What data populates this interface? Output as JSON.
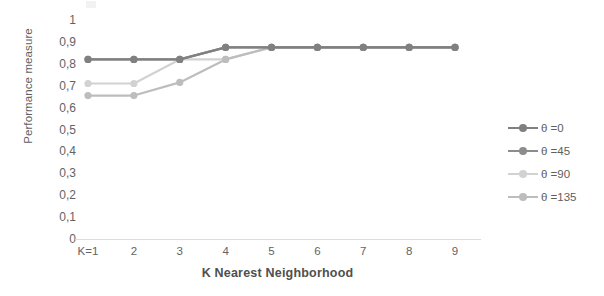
{
  "chart_data": {
    "type": "line",
    "title": "",
    "xlabel": "K Nearest Neighborhood",
    "ylabel": "Performance measure",
    "categories": [
      "K=1",
      "2",
      "3",
      "4",
      "5",
      "6",
      "7",
      "8",
      "9"
    ],
    "x": [
      1,
      2,
      3,
      4,
      5,
      6,
      7,
      8,
      9
    ],
    "ylim": [
      0,
      1
    ],
    "ytick_labels": [
      "1",
      "0,9",
      "0,8",
      "0,7",
      "0,6",
      "0,5",
      "0,4",
      "0,3",
      "0,2",
      "0,1",
      "0"
    ],
    "ytick_values": [
      1,
      0.9,
      0.8,
      0.7,
      0.6,
      0.5,
      0.4,
      0.3,
      0.2,
      0.1,
      0
    ],
    "grid": false,
    "legend_position": "right",
    "series": [
      {
        "name": "θ =0",
        "color": "#808080",
        "values": [
          0.82,
          0.82,
          0.82,
          0.875,
          0.875,
          0.875,
          0.875,
          0.875,
          0.875
        ]
      },
      {
        "name": "θ =45",
        "color": "#8c8c8c",
        "values": [
          0.82,
          0.82,
          0.82,
          0.875,
          0.875,
          0.875,
          0.875,
          0.875,
          0.875
        ]
      },
      {
        "name": "θ =90",
        "color": "#d2d2d2",
        "values": [
          0.71,
          0.71,
          0.82,
          0.82,
          0.875,
          0.875,
          0.875,
          0.875,
          0.875
        ]
      },
      {
        "name": "θ =135",
        "color": "#bdbdbd",
        "values": [
          0.655,
          0.655,
          0.715,
          0.82,
          0.875,
          0.875,
          0.875,
          0.875,
          0.875
        ]
      }
    ]
  },
  "legend": {
    "items": [
      {
        "label": "θ =0"
      },
      {
        "label": "θ =45"
      },
      {
        "label": "θ =90"
      },
      {
        "label": "θ =135"
      }
    ]
  },
  "axes": {
    "y_title": "Performance measure",
    "x_title": "K Nearest Neighborhood"
  }
}
